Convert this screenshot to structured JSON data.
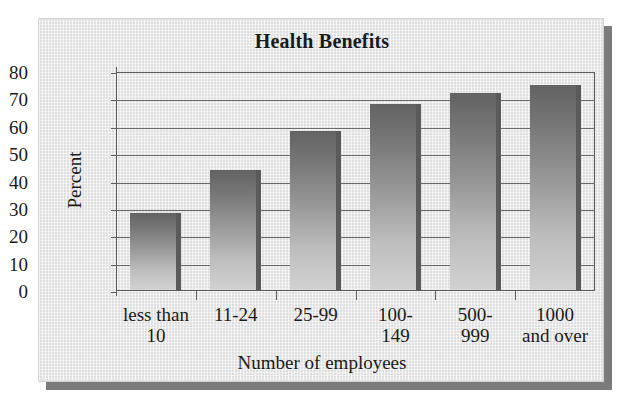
{
  "figure": {
    "title": "Health Benefits",
    "background_color": "#e8e8e8",
    "shadow_color": "#7b7b7b"
  },
  "chart_data": {
    "type": "bar",
    "title": "Health Benefits",
    "xlabel": "Number of employees",
    "ylabel": "Percent",
    "categories": [
      "less than 10",
      "11-24",
      "25-99",
      "100-149",
      "500-999",
      "1000 and over"
    ],
    "values": [
      28,
      44,
      58,
      68,
      72,
      75
    ],
    "ylim": [
      0,
      80
    ],
    "ytick_labels": [
      "80",
      "70",
      "60",
      "50",
      "40",
      "30",
      "20",
      "10",
      "0"
    ],
    "ytick_values": [
      80,
      70,
      60,
      50,
      40,
      30,
      20,
      10,
      0
    ],
    "grid": true,
    "legend": false,
    "bar_color_top": "#636363",
    "bar_color_bottom": "#d2d2d2",
    "bar_edge_color": "#5a5a5a",
    "axis_color": "#5d5d5d"
  },
  "category_lines": {
    "0": [
      "less than",
      "10"
    ],
    "1": [
      "11-24",
      ""
    ],
    "2": [
      "25-99",
      ""
    ],
    "3": [
      "100-",
      "149"
    ],
    "4": [
      "500-",
      "999"
    ],
    "5": [
      "1000",
      "and over"
    ]
  }
}
